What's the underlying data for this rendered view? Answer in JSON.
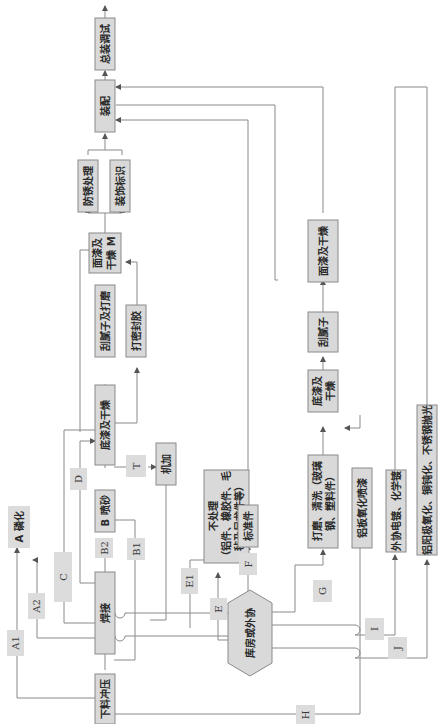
{
  "diagram": {
    "orientation": "rotated 90° counter-clockwise (flow runs bottom to top)",
    "nodes": {
      "blanking": "下料冲压",
      "welding": "焊接",
      "sandblast": "B 喷砂",
      "phosphating": "A 磷化",
      "primer": "底漆及干燥",
      "machining": "机加",
      "putty_sanding": "刮腻子及打磨",
      "sealant": "打密封胶",
      "topcoat_m": "面漆及干燥 M",
      "rustproof": "防锈处理",
      "marking": "装饰标识",
      "assembly": "装配",
      "final_test": "总装调试",
      "no_treatment_line1": "不处理",
      "no_treatment_line2": "（铝件、橡胶件、毛",
      "no_treatment_line3": "毡及尼龙件等）",
      "standard_parts": "标准件",
      "warehouse": "库房或外协",
      "sanding_clean_line1": "打磨、清洗（玻璃",
      "sanding_clean_line2": "钢、塑料件）",
      "right_primer_line1": "底漆及",
      "right_primer_line2": "干燥",
      "right_putty": "刮腻子",
      "right_topcoat": "面漆及干燥",
      "aluminum_oxidation_spray": "铝板氧化喷漆",
      "outsourced_plating": "外协电镀、化学镀",
      "anodizing": "铝阳极氧化、铜钝化、不锈钢抛光",
      "topcoat_m_line1": "面漆及",
      "topcoat_m_line2": "干燥 M"
    },
    "path_labels": {
      "A1": "A1",
      "A2": "A2",
      "B1": "B1",
      "B2": "B2",
      "C": "C",
      "D": "D",
      "E": "E",
      "E1": "E1",
      "F": "F",
      "G": "G",
      "H": "H",
      "I": "I",
      "J": "J",
      "T": "T"
    }
  }
}
